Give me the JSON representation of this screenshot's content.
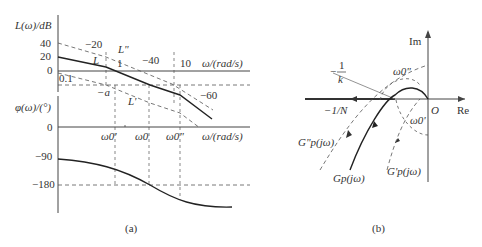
{
  "panel_a": {
    "caption": "(a)",
    "magnitude": {
      "ylabel": "L(ω)/dB",
      "yticks": [
        "40",
        "20",
        "0"
      ],
      "xlabel": "ω/(rad/s)",
      "x_tick_low": "0.1",
      "x_tick_1": "1",
      "x_tick_10": "10",
      "slope_labels": [
        "−20",
        "−40",
        "−60"
      ],
      "curve_labels": {
        "L": "L",
        "L_pp": "L\"",
        "L_p": "L'"
      },
      "level_label": "−a"
    },
    "phase": {
      "ylabel": "φ(ω)/(°)",
      "yticks": [
        "0",
        "−90",
        "−180"
      ],
      "xlabel": "ω/(rad/s)",
      "omega_labels": [
        "ω0'",
        "ω0",
        "ω0\""
      ]
    }
  },
  "panel_b": {
    "caption": "(b)",
    "axis_im": "Im",
    "axis_re": "Re",
    "origin": "O",
    "neg_inv_k": {
      "minus": "−",
      "num": "1",
      "den": "k"
    },
    "neg_inv_N": "−1/N",
    "omega_pp": "ω0\"",
    "omega_p": "ω0'",
    "curves": {
      "G": "Gp(jω)",
      "G_pp": "G\"p(jω)",
      "G_p": "G'p(jω)"
    }
  },
  "colors": {
    "ink": "#222222",
    "dash": "#555555",
    "axis": "#444444",
    "light": "#888888"
  }
}
